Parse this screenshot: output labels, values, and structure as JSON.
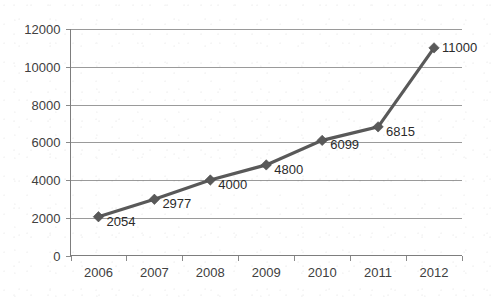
{
  "chart_data": {
    "type": "line",
    "title": "",
    "subtitle": "",
    "xlabel": "",
    "ylabel": "",
    "categories": [
      "2006",
      "2007",
      "2008",
      "2009",
      "2010",
      "2011",
      "2012"
    ],
    "values": [
      2054,
      2977,
      4000,
      4800,
      6099,
      6815,
      11000
    ],
    "data_labels": [
      "2054",
      "2977",
      "4000",
      "4800",
      "6099",
      "6815",
      "11000"
    ],
    "series": [
      {
        "name": "",
        "values": [
          2054,
          2977,
          4000,
          4800,
          6099,
          6815,
          11000
        ]
      }
    ],
    "ylim": [
      0,
      12000
    ],
    "ytick_values": [
      0,
      2000,
      4000,
      6000,
      8000,
      10000,
      12000
    ],
    "ytick_labels": [
      "0",
      "2000",
      "4000",
      "6000",
      "8000",
      "10000",
      "12000"
    ],
    "xtick_labels": [
      "2006",
      "2007",
      "2008",
      "2009",
      "2010",
      "2011",
      "2012"
    ],
    "grid": true,
    "grid_axis": "y",
    "legend": false,
    "legend_position": "none",
    "marker": "diamond",
    "colors": {
      "line": "#595959",
      "marker": "#595959",
      "gridline": "#9a9a9a",
      "axis": "#7d7d7d",
      "tick_label": "#404040",
      "data_label": "#2b2b2b",
      "background": "#ffffff"
    },
    "annotations": []
  },
  "axes": {
    "y_axis_name": "value-axis",
    "x_axis_name": "category-axis"
  }
}
